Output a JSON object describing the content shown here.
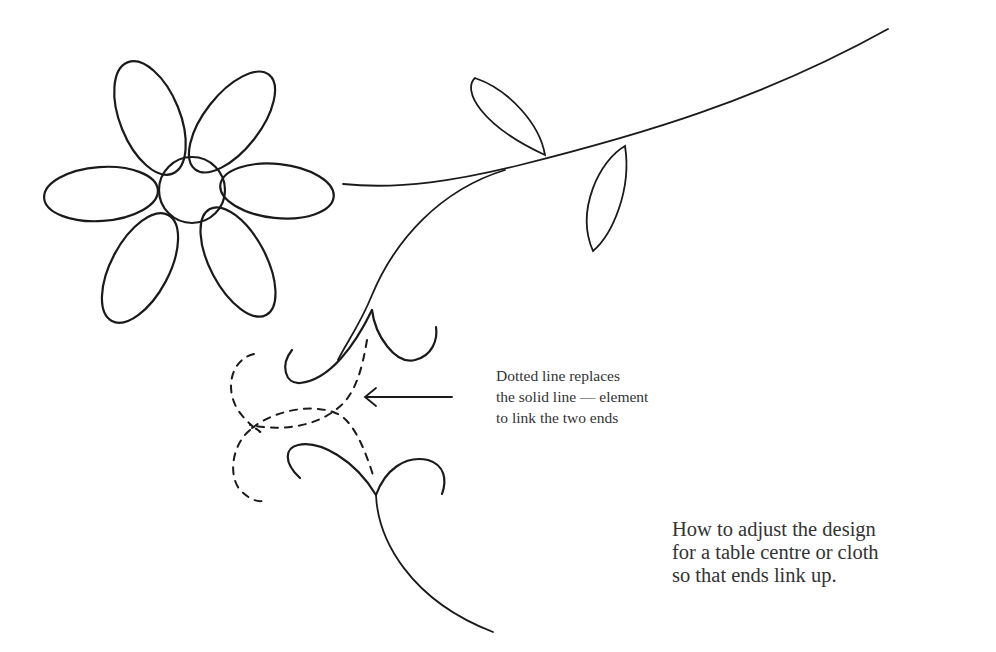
{
  "figure": {
    "annotation": {
      "lines": [
        "Dotted line replaces",
        "the solid line — element",
        "to link the two ends"
      ],
      "arrow_direction": "left"
    },
    "caption": {
      "lines": [
        "How to adjust the design",
        "for a table centre or cloth",
        "so that ends link up."
      ]
    },
    "colors": {
      "ink": "#1a1a1a",
      "text": "#333333",
      "background": "#ffffff"
    }
  }
}
